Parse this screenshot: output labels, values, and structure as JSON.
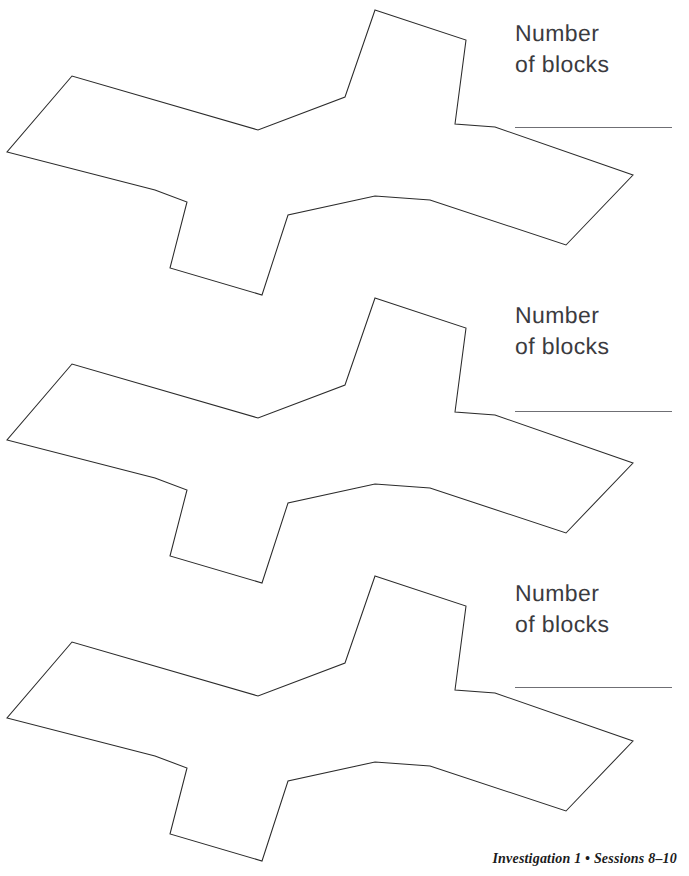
{
  "page": {
    "width": 689,
    "height": 876,
    "background_color": "#ffffff",
    "ink_color": "#2b2b2b",
    "text_color": "#3b3b3f",
    "rule_color": "#6f6f74"
  },
  "prompts": [
    {
      "label": "Number\nof blocks",
      "label_x": 515,
      "label_y": 18,
      "line_x": 515,
      "line_y": 127
    },
    {
      "label": "Number\nof blocks",
      "label_x": 515,
      "label_y": 300,
      "line_x": 515,
      "line_y": 411
    },
    {
      "label": "Number\nof blocks",
      "label_x": 515,
      "label_y": 578,
      "line_x": 515,
      "line_y": 687
    }
  ],
  "figures": [
    {
      "name": "block-shape-1",
      "offset_y": 0,
      "points": "375,10 466,40 455,124 495,127 633,175 566,245 430,200 375,196 288,215 262,295 170,268 187,202 155,190 7,152 72,76 258,130 345,97"
    },
    {
      "name": "block-shape-2",
      "offset_y": 288,
      "points": "375,10 466,40 455,124 495,127 633,175 566,245 430,200 375,196 288,215 262,295 170,268 187,202 155,190 7,152 72,76 258,130 345,97"
    },
    {
      "name": "block-shape-3",
      "offset_y": 566,
      "points": "375,10 466,40 455,124 495,127 633,175 566,245 430,200 375,196 288,215 262,295 170,268 187,202 155,190 7,152 72,76 258,130 345,97"
    }
  ],
  "footer": {
    "text": "Investigation 1 • Sessions 8–10"
  }
}
